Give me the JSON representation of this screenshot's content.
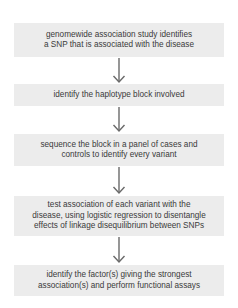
{
  "flowchart": {
    "steps": [
      {
        "label": "genomewide association study identifies\na SNP that is associated with the disease"
      },
      {
        "label": "identify the haplotype block involved"
      },
      {
        "label": "sequence the block in a panel of cases and\ncontrols to identify every variant"
      },
      {
        "label": "test association of each variant with the\ndisease, using logistic regression to disentangle\neffects of linkage disequilibrium between SNPs"
      },
      {
        "label": "identify the factor(s) giving the strongest\nassociation(s) and perform functional assays"
      }
    ],
    "box_color": "#ececec",
    "arrow_color": "#6a6a6a",
    "text_color": "#3a3a3a"
  }
}
